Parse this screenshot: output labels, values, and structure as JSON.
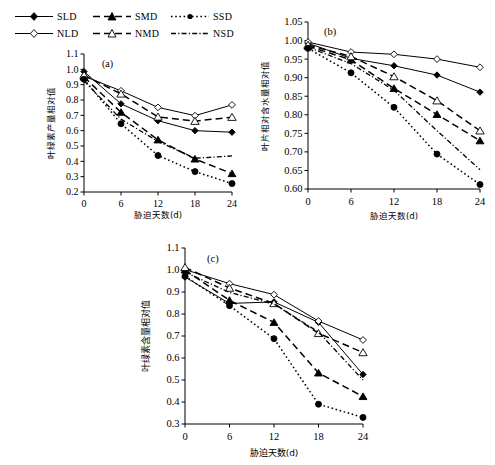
{
  "legend": {
    "items": [
      {
        "key": "SLD",
        "label": "SLD",
        "dash": "none",
        "marker": "filled-diamond",
        "icon": "legend-line-sld"
      },
      {
        "key": "SMD",
        "label": "SMD",
        "dash": "6,4",
        "marker": "filled-triangle",
        "icon": "legend-line-smd"
      },
      {
        "key": "SSD",
        "label": "SSD",
        "dash": "1.5,2.5",
        "marker": "filled-circle",
        "icon": "legend-line-ssd"
      },
      {
        "key": "NLD",
        "label": "NLD",
        "dash": "none",
        "marker": "open-diamond",
        "icon": "legend-line-nld"
      },
      {
        "key": "NMD",
        "label": "NMD",
        "dash": "6,4",
        "marker": "open-triangle",
        "icon": "legend-line-nmd"
      },
      {
        "key": "NSD",
        "label": "NSD",
        "dash": "5,2,1,2",
        "marker": "none",
        "icon": "legend-line-nsd"
      }
    ]
  },
  "common": {
    "xlabel": "胁迫天数(d)",
    "x_ticks": [
      "0",
      "6",
      "12",
      "18",
      "24"
    ],
    "x": [
      0,
      6,
      12,
      18,
      24
    ]
  },
  "chart_data": [
    {
      "id": "a",
      "type": "line",
      "title": "(a)",
      "xlabel": "胁迫天数(d)",
      "ylabel": "叶绿素产量相对值",
      "xlim": [
        0,
        24
      ],
      "ylim": [
        0.2,
        1.1
      ],
      "ytick_step": 0.1,
      "x": [
        0,
        6,
        12,
        18,
        24
      ],
      "x_ticks": [
        "0",
        "6",
        "12",
        "18",
        "24"
      ],
      "y_ticks": [
        "0.2",
        "0.3",
        "0.4",
        "0.5",
        "0.6",
        "0.7",
        "0.8",
        "0.9",
        "1.0",
        "1.1"
      ],
      "grid": false,
      "legend_position": "top-left-outside",
      "series": [
        {
          "name": "SLD",
          "values": [
            0.985,
            0.775,
            0.665,
            0.6,
            0.59
          ]
        },
        {
          "name": "NLD",
          "values": [
            0.955,
            0.86,
            0.752,
            0.698,
            0.768
          ]
        },
        {
          "name": "SMD",
          "values": [
            0.95,
            0.72,
            0.54,
            0.415,
            0.32
          ]
        },
        {
          "name": "NMD",
          "values": [
            0.962,
            0.84,
            0.69,
            0.662,
            0.688
          ]
        },
        {
          "name": "SSD",
          "values": [
            0.935,
            0.645,
            0.438,
            0.333,
            0.255
          ]
        },
        {
          "name": "NSD",
          "values": [
            0.925,
            0.675,
            0.53,
            0.42,
            0.435
          ]
        }
      ]
    },
    {
      "id": "b",
      "type": "line",
      "title": "(b)",
      "xlabel": "胁迫天数(d)",
      "ylabel": "叶片相对含水量相对值",
      "xlim": [
        0,
        24
      ],
      "ylim": [
        0.6,
        1.05
      ],
      "ytick_step": 0.05,
      "x": [
        0,
        6,
        12,
        18,
        24
      ],
      "x_ticks": [
        "0",
        "6",
        "12",
        "18",
        "24"
      ],
      "y_ticks": [
        "0.60",
        "0.65",
        "0.70",
        "0.75",
        "0.80",
        "0.85",
        "0.90",
        "0.95",
        "1.00",
        "1.05"
      ],
      "grid": false,
      "legend_position": "none",
      "series": [
        {
          "name": "SLD",
          "values": [
            0.993,
            0.952,
            0.932,
            0.907,
            0.861
          ]
        },
        {
          "name": "NLD",
          "values": [
            0.996,
            0.969,
            0.963,
            0.95,
            0.928
          ]
        },
        {
          "name": "SMD",
          "values": [
            0.985,
            0.948,
            0.871,
            0.801,
            0.73
          ]
        },
        {
          "name": "NMD",
          "values": [
            0.988,
            0.957,
            0.903,
            0.838,
            0.757
          ]
        },
        {
          "name": "SSD",
          "values": [
            0.979,
            0.913,
            0.82,
            0.694,
            0.612
          ]
        },
        {
          "name": "NSD",
          "values": [
            0.982,
            0.938,
            0.866,
            0.757,
            0.652
          ]
        }
      ]
    },
    {
      "id": "c",
      "type": "line",
      "title": "(c)",
      "xlabel": "胁迫天数(d)",
      "ylabel": "叶绿素含量相对值",
      "xlim": [
        0,
        24
      ],
      "ylim": [
        0.3,
        1.1
      ],
      "ytick_step": 0.1,
      "x": [
        0,
        6,
        12,
        18,
        24
      ],
      "x_ticks": [
        "0",
        "6",
        "12",
        "18",
        "24"
      ],
      "y_ticks": [
        "0.3",
        "0.4",
        "0.5",
        "0.6",
        "0.7",
        "0.8",
        "0.9",
        "1.0",
        "1.1"
      ],
      "grid": false,
      "legend_position": "none",
      "series": [
        {
          "name": "SLD",
          "values": [
            0.968,
            0.848,
            0.855,
            0.762,
            0.525
          ]
        },
        {
          "name": "NLD",
          "values": [
            1.002,
            0.938,
            0.888,
            0.768,
            0.682
          ]
        },
        {
          "name": "SMD",
          "values": [
            1.0,
            0.862,
            0.762,
            0.532,
            0.425
          ]
        },
        {
          "name": "NMD",
          "values": [
            1.012,
            0.918,
            0.848,
            0.712,
            0.625
          ]
        },
        {
          "name": "SSD",
          "values": [
            0.972,
            0.838,
            0.688,
            0.39,
            0.33
          ]
        },
        {
          "name": "NSD",
          "values": [
            0.99,
            0.898,
            0.845,
            0.718,
            0.5
          ]
        }
      ]
    }
  ],
  "style": {
    "line_color": "#000000",
    "background": "#ffffff",
    "dash_sld": "none",
    "dash_smd": "7,4",
    "dash_ssd": "1.6,2.6",
    "dash_nld": "none",
    "dash_nmd": "7,4",
    "dash_nsd": "5,2.2,1.2,2.2"
  }
}
